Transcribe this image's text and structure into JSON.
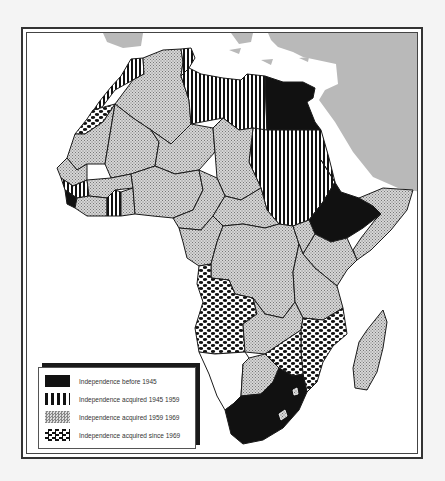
{
  "map": {
    "subject": "Africa",
    "theme": "Independence of African states",
    "colors": {
      "sea": "#ffffff",
      "other_land": "#b9b9b9",
      "border": "#1a1a1a",
      "frame": "#333333"
    }
  },
  "legend": {
    "items": [
      {
        "label": "Independence before 1945",
        "pattern": "solid-black"
      },
      {
        "label": "Independence acquired 1945  1959",
        "pattern": "vertical-stripes"
      },
      {
        "label": "Independence acquired 1959  1969",
        "pattern": "fine-crosshatch"
      },
      {
        "label": "Independence acquired since 1969",
        "pattern": "checker-wave"
      }
    ]
  }
}
